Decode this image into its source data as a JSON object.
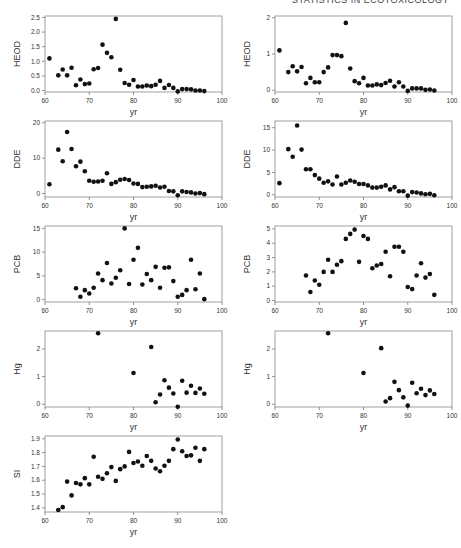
{
  "header": {
    "running_title": "STATISTICS IN ECOTOXICOLOGY"
  },
  "chart_data": [
    {
      "id": "heod_left",
      "type": "scatter",
      "xlabel": "yr",
      "ylabel": "HEOD",
      "xlim": [
        60,
        100
      ],
      "ylim": [
        -0.05,
        2.55
      ],
      "xticks": [
        60,
        70,
        80,
        90,
        100
      ],
      "yticks": [
        0.0,
        0.5,
        1.0,
        1.5,
        2.0,
        2.5
      ],
      "ytick_labels": [
        "0.0",
        "0.5",
        "1.0",
        "1.5",
        "2.0",
        "2.5"
      ],
      "x": [
        61,
        63,
        64,
        65,
        66,
        67,
        68,
        69,
        70,
        71,
        72,
        73,
        74,
        75,
        76,
        77,
        78,
        79,
        80,
        81,
        82,
        83,
        84,
        85,
        86,
        87,
        88,
        89,
        90,
        91,
        92,
        93,
        94,
        95,
        96
      ],
      "y": [
        1.1,
        0.52,
        0.72,
        0.52,
        0.78,
        0.18,
        0.38,
        0.22,
        0.24,
        0.73,
        0.77,
        1.57,
        1.29,
        1.14,
        2.45,
        0.71,
        0.26,
        0.2,
        0.36,
        0.14,
        0.14,
        0.17,
        0.15,
        0.2,
        0.33,
        0.09,
        0.19,
        0.09,
        -0.03,
        0.05,
        0.05,
        0.04,
        0.0,
        0.0,
        -0.02
      ]
    },
    {
      "id": "heod_right",
      "type": "scatter",
      "xlabel": "yr",
      "ylabel": "HEOD",
      "xlim": [
        60,
        100
      ],
      "ylim": [
        -0.05,
        2.05
      ],
      "xticks": [
        60,
        70,
        80,
        90,
        100
      ],
      "yticks": [
        0,
        1,
        2
      ],
      "ytick_labels": [
        "0",
        "1",
        "2"
      ],
      "x": [
        61,
        63,
        64,
        65,
        66,
        67,
        68,
        69,
        70,
        71,
        72,
        73,
        74,
        75,
        76,
        77,
        78,
        79,
        80,
        81,
        82,
        83,
        84,
        85,
        86,
        87,
        88,
        89,
        90,
        91,
        92,
        93,
        94,
        95,
        96
      ],
      "y": [
        1.1,
        0.5,
        0.66,
        0.52,
        0.64,
        0.19,
        0.34,
        0.22,
        0.22,
        0.5,
        0.63,
        0.97,
        0.97,
        0.94,
        1.86,
        0.6,
        0.25,
        0.19,
        0.34,
        0.13,
        0.13,
        0.16,
        0.14,
        0.2,
        0.26,
        0.1,
        0.22,
        0.1,
        -0.02,
        0.05,
        0.05,
        0.05,
        0.01,
        0.02,
        -0.01
      ]
    },
    {
      "id": "dde_left",
      "type": "scatter",
      "xlabel": "yr",
      "ylabel": "DDE",
      "xlim": [
        60,
        100
      ],
      "ylim": [
        -1,
        20.5
      ],
      "xticks": [
        60,
        70,
        80,
        90,
        100
      ],
      "yticks": [
        0,
        10,
        20
      ],
      "ytick_labels": [
        "0",
        "10",
        "20"
      ],
      "x": [
        61,
        63,
        64,
        65,
        66,
        67,
        68,
        69,
        70,
        71,
        72,
        73,
        74,
        75,
        76,
        77,
        78,
        79,
        80,
        81,
        82,
        83,
        84,
        85,
        86,
        87,
        88,
        89,
        90,
        91,
        92,
        93,
        94,
        95,
        96
      ],
      "y": [
        2.6,
        12.4,
        9.1,
        17.4,
        12.6,
        7.7,
        9.0,
        6.3,
        3.6,
        3.3,
        3.4,
        3.6,
        5.7,
        2.7,
        3.2,
        3.9,
        4.1,
        3.8,
        2.8,
        2.7,
        1.8,
        1.9,
        2.0,
        2.2,
        1.7,
        1.9,
        0.7,
        0.6,
        -0.5,
        0.6,
        0.4,
        0.3,
        0.0,
        0.1,
        -0.2
      ]
    },
    {
      "id": "dde_right",
      "type": "scatter",
      "xlabel": "yr",
      "ylabel": "DDE",
      "xlim": [
        60,
        100
      ],
      "ylim": [
        -0.5,
        16.5
      ],
      "xticks": [
        60,
        70,
        80,
        90,
        100
      ],
      "yticks": [
        0,
        5,
        10,
        15
      ],
      "ytick_labels": [
        "0",
        "5",
        "10",
        "15"
      ],
      "x": [
        61,
        63,
        64,
        65,
        66,
        67,
        68,
        69,
        70,
        71,
        72,
        73,
        74,
        75,
        76,
        77,
        78,
        79,
        80,
        81,
        82,
        83,
        84,
        85,
        86,
        87,
        88,
        89,
        90,
        91,
        92,
        93,
        94,
        95,
        96
      ],
      "y": [
        2.6,
        10.2,
        8.5,
        15.5,
        10.1,
        5.7,
        5.7,
        4.4,
        3.6,
        2.7,
        3.0,
        2.3,
        4.1,
        2.3,
        2.7,
        3.2,
        2.9,
        2.4,
        2.4,
        2.1,
        1.6,
        1.6,
        1.8,
        2.1,
        1.2,
        1.7,
        0.8,
        0.8,
        -0.2,
        0.6,
        0.5,
        0.3,
        0.1,
        0.2,
        -0.1
      ]
    },
    {
      "id": "pcb_left",
      "type": "scatter",
      "xlabel": "yr",
      "ylabel": "PCB",
      "xlim": [
        60,
        100
      ],
      "ylim": [
        -0.5,
        15.5
      ],
      "xticks": [
        60,
        70,
        80,
        90,
        100
      ],
      "yticks": [
        0,
        5,
        10,
        15
      ],
      "ytick_labels": [
        "0",
        "5",
        "10",
        "15"
      ],
      "x": [
        67,
        68,
        69,
        70,
        71,
        72,
        73,
        74,
        75,
        76,
        77,
        78,
        79,
        80,
        81,
        82,
        83,
        84,
        85,
        86,
        87,
        88,
        89,
        90,
        91,
        92,
        93,
        94,
        95,
        96
      ],
      "y": [
        2.4,
        0.6,
        2.0,
        1.3,
        2.5,
        5.5,
        4.1,
        7.7,
        3.4,
        4.6,
        6.2,
        15.0,
        3.3,
        8.4,
        10.9,
        3.2,
        5.4,
        4.1,
        6.9,
        2.5,
        6.7,
        6.8,
        3.9,
        0.6,
        1.0,
        2.0,
        8.4,
        2.2,
        5.5,
        0.1
      ]
    },
    {
      "id": "pcb_right",
      "type": "scatter",
      "xlabel": "yr",
      "ylabel": "PCB",
      "xlim": [
        60,
        100
      ],
      "ylim": [
        -0.1,
        5.2
      ],
      "xticks": [
        60,
        70,
        80,
        90,
        100
      ],
      "yticks": [
        0,
        1,
        2,
        3,
        4,
        5
      ],
      "ytick_labels": [
        "0",
        "1",
        "2",
        "3",
        "4",
        "5"
      ],
      "x": [
        67,
        68,
        69,
        70,
        71,
        72,
        73,
        74,
        75,
        76,
        77,
        78,
        79,
        80,
        81,
        82,
        83,
        84,
        85,
        86,
        87,
        88,
        89,
        90,
        91,
        92,
        93,
        94,
        95,
        96
      ],
      "y": [
        1.75,
        0.6,
        1.4,
        1.1,
        2.0,
        2.85,
        2.0,
        2.5,
        2.75,
        4.3,
        4.65,
        4.95,
        2.7,
        4.5,
        4.3,
        2.25,
        2.45,
        2.55,
        3.4,
        1.7,
        3.75,
        3.75,
        3.4,
        0.95,
        0.8,
        1.75,
        2.6,
        1.6,
        1.85,
        0.4
      ]
    },
    {
      "id": "hg_left",
      "type": "scatter",
      "xlabel": "yr",
      "ylabel": "Hg",
      "xlim": [
        60,
        100
      ],
      "ylim": [
        -0.1,
        2.65
      ],
      "xticks": [
        60,
        70,
        80,
        90,
        100
      ],
      "yticks": [
        0,
        1,
        2
      ],
      "ytick_labels": [
        "0",
        "1",
        "2"
      ],
      "x": [
        72,
        80,
        84,
        85,
        86,
        87,
        88,
        89,
        90,
        91,
        92,
        93,
        94,
        95,
        96
      ],
      "y": [
        2.57,
        1.13,
        2.07,
        0.07,
        0.35,
        0.87,
        0.6,
        0.39,
        -0.09,
        0.85,
        0.42,
        0.67,
        0.41,
        0.57,
        0.38
      ]
    },
    {
      "id": "hg_right",
      "type": "scatter",
      "xlabel": "yr",
      "ylabel": "Hg",
      "xlim": [
        60,
        100
      ],
      "ylim": [
        -0.1,
        2.65
      ],
      "xticks": [
        60,
        70,
        80,
        90,
        100
      ],
      "yticks": [
        0,
        1,
        2
      ],
      "ytick_labels": [
        "0",
        "1",
        "2"
      ],
      "x": [
        72,
        80,
        84,
        85,
        86,
        87,
        88,
        89,
        90,
        91,
        92,
        93,
        94,
        95,
        96
      ],
      "y": [
        2.57,
        1.13,
        2.03,
        0.1,
        0.22,
        0.81,
        0.51,
        0.25,
        -0.05,
        0.78,
        0.4,
        0.56,
        0.33,
        0.5,
        0.37
      ]
    },
    {
      "id": "si_left",
      "type": "scatter",
      "xlabel": "yr",
      "ylabel": "SI",
      "xlim": [
        60,
        100
      ],
      "ylim": [
        1.37,
        1.92
      ],
      "xticks": [
        60,
        70,
        80,
        90,
        100
      ],
      "yticks": [
        1.4,
        1.5,
        1.6,
        1.7,
        1.8,
        1.9
      ],
      "ytick_labels": [
        "1.4",
        "1.5",
        "1.6",
        "1.7",
        "1.8",
        "1.9"
      ],
      "x": [
        63,
        64,
        65,
        66,
        67,
        68,
        69,
        70,
        71,
        72,
        73,
        74,
        75,
        76,
        77,
        78,
        79,
        80,
        81,
        82,
        83,
        84,
        85,
        86,
        87,
        88,
        89,
        90,
        91,
        92,
        93,
        94,
        95,
        96
      ],
      "y": [
        1.385,
        1.405,
        1.59,
        1.49,
        1.58,
        1.57,
        1.615,
        1.57,
        1.77,
        1.625,
        1.61,
        1.65,
        1.695,
        1.595,
        1.68,
        1.7,
        1.805,
        1.725,
        1.735,
        1.705,
        1.775,
        1.74,
        1.685,
        1.665,
        1.705,
        1.74,
        1.825,
        1.895,
        1.81,
        1.775,
        1.78,
        1.835,
        1.74,
        1.825
      ]
    }
  ]
}
